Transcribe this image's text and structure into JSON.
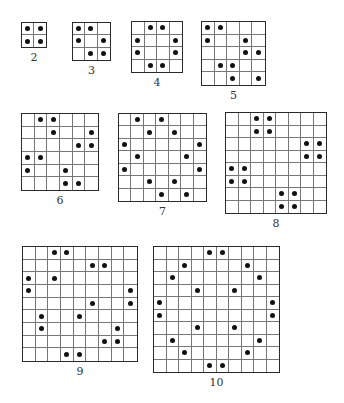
{
  "figures": [
    {
      "label": "2",
      "n": 2,
      "x": 21,
      "y": 22,
      "size": 26,
      "dots": [
        [
          0,
          0
        ],
        [
          0,
          1
        ],
        [
          1,
          0
        ],
        [
          1,
          1
        ]
      ]
    },
    {
      "label": "3",
      "n": 3,
      "x": 72,
      "y": 22,
      "size": 39,
      "dots": [
        [
          0,
          0
        ],
        [
          0,
          1
        ],
        [
          1,
          0
        ],
        [
          1,
          2
        ],
        [
          2,
          1
        ],
        [
          2,
          2
        ]
      ]
    },
    {
      "label": "4",
      "n": 4,
      "x": 131,
      "y": 21,
      "size": 52,
      "dots": [
        [
          0,
          1
        ],
        [
          0,
          2
        ],
        [
          1,
          0
        ],
        [
          1,
          3
        ],
        [
          2,
          0
        ],
        [
          2,
          3
        ],
        [
          3,
          1
        ],
        [
          3,
          2
        ]
      ]
    },
    {
      "label": "5",
      "n": 5,
      "x": 201,
      "y": 21,
      "size": 65,
      "dots": [
        [
          0,
          0
        ],
        [
          0,
          1
        ],
        [
          1,
          0
        ],
        [
          1,
          3
        ],
        [
          2,
          3
        ],
        [
          2,
          4
        ],
        [
          3,
          1
        ],
        [
          3,
          2
        ],
        [
          4,
          2
        ],
        [
          4,
          4
        ]
      ]
    },
    {
      "label": "6",
      "n": 6,
      "x": 21,
      "y": 113,
      "size": 78,
      "dots": [
        [
          0,
          1
        ],
        [
          0,
          2
        ],
        [
          1,
          2
        ],
        [
          1,
          5
        ],
        [
          2,
          4
        ],
        [
          2,
          5
        ],
        [
          3,
          0
        ],
        [
          3,
          1
        ],
        [
          4,
          0
        ],
        [
          4,
          3
        ],
        [
          5,
          3
        ],
        [
          5,
          4
        ]
      ]
    },
    {
      "label": "7",
      "n": 7,
      "x": 118,
      "y": 113,
      "size": 89,
      "dots": [
        [
          0,
          1
        ],
        [
          0,
          3
        ],
        [
          1,
          2
        ],
        [
          1,
          4
        ],
        [
          2,
          0
        ],
        [
          2,
          6
        ],
        [
          3,
          1
        ],
        [
          3,
          5
        ],
        [
          4,
          0
        ],
        [
          4,
          6
        ],
        [
          5,
          2
        ],
        [
          5,
          4
        ],
        [
          6,
          3
        ],
        [
          6,
          5
        ]
      ]
    },
    {
      "label": "8",
      "n": 8,
      "x": 225,
      "y": 112,
      "size": 102,
      "dots": [
        [
          0,
          2
        ],
        [
          0,
          3
        ],
        [
          1,
          2
        ],
        [
          1,
          3
        ],
        [
          2,
          6
        ],
        [
          2,
          7
        ],
        [
          3,
          6
        ],
        [
          3,
          7
        ],
        [
          4,
          0
        ],
        [
          4,
          1
        ],
        [
          5,
          0
        ],
        [
          5,
          1
        ],
        [
          6,
          4
        ],
        [
          6,
          5
        ],
        [
          7,
          4
        ],
        [
          7,
          5
        ]
      ]
    },
    {
      "label": "9",
      "n": 9,
      "x": 22,
      "y": 246,
      "size": 116,
      "dots": [
        [
          0,
          2
        ],
        [
          0,
          3
        ],
        [
          1,
          5
        ],
        [
          1,
          6
        ],
        [
          2,
          0
        ],
        [
          2,
          2
        ],
        [
          3,
          0
        ],
        [
          3,
          8
        ],
        [
          4,
          5
        ],
        [
          4,
          8
        ],
        [
          5,
          1
        ],
        [
          5,
          4
        ],
        [
          6,
          1
        ],
        [
          6,
          7
        ],
        [
          7,
          6
        ],
        [
          7,
          7
        ],
        [
          8,
          3
        ],
        [
          8,
          4
        ]
      ]
    },
    {
      "label": "10",
      "n": 10,
      "x": 153,
      "y": 246,
      "size": 127,
      "dots": [
        [
          0,
          4
        ],
        [
          0,
          5
        ],
        [
          1,
          2
        ],
        [
          1,
          7
        ],
        [
          2,
          1
        ],
        [
          2,
          8
        ],
        [
          3,
          3
        ],
        [
          3,
          6
        ],
        [
          4,
          0
        ],
        [
          4,
          9
        ],
        [
          5,
          0
        ],
        [
          5,
          9
        ],
        [
          6,
          3
        ],
        [
          6,
          6
        ],
        [
          7,
          1
        ],
        [
          7,
          8
        ],
        [
          8,
          2
        ],
        [
          8,
          7
        ],
        [
          9,
          4
        ],
        [
          9,
          5
        ]
      ]
    }
  ]
}
